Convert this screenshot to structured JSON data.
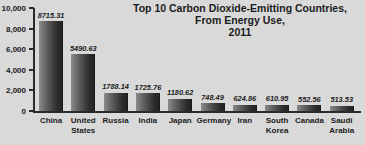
{
  "chart_data": {
    "type": "bar",
    "title": "Top 10 Carbon Dioxide-Emitting Countries, From Energy Use, 2011",
    "title_lines": [
      "Top 10 Carbon Dioxide-Emitting Countries,",
      "From Energy Use,",
      "2011"
    ],
    "xlabel": "",
    "ylabel": "",
    "ylim": [
      0,
      10000
    ],
    "yticks": [
      0,
      2000,
      4000,
      6000,
      8000,
      10000
    ],
    "ytick_labels": [
      "0",
      "2,000",
      "4,000",
      "6,000",
      "8,000",
      "10,000"
    ],
    "grid": false,
    "legend": false,
    "categories": [
      "China",
      "United States",
      "Russia",
      "India",
      "Japan",
      "Germany",
      "Iran",
      "South Korea",
      "Canada",
      "Saudi Arabia"
    ],
    "category_lines": [
      [
        "China"
      ],
      [
        "United",
        "States"
      ],
      [
        "Russia"
      ],
      [
        "India"
      ],
      [
        "Japan"
      ],
      [
        "Germany"
      ],
      [
        "Iran"
      ],
      [
        "South",
        "Korea"
      ],
      [
        "Canada"
      ],
      [
        "Saudi",
        "Arabia"
      ]
    ],
    "values": [
      8715.31,
      5490.63,
      1788.14,
      1725.76,
      1180.62,
      748.49,
      624.86,
      610.95,
      552.56,
      513.53
    ],
    "value_labels": [
      "8715.31",
      "5490.63",
      "1788.14",
      "1725.76",
      "1180.62",
      "748.49",
      "624.86",
      "610.95",
      "552.56",
      "513.53"
    ],
    "colors": {
      "background": "#d9d9d9",
      "bar_light": "#8d8d8d",
      "bar_dark": "#232323",
      "axis": "#2a2a2a",
      "text": "#1b1b1b"
    }
  }
}
